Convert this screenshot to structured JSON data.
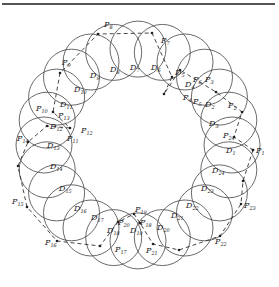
{
  "figure": {
    "type": "ring-of-overlapping-circles",
    "circle_count": 24,
    "ring_center": [
      138,
      145
    ],
    "ring_radius": 94,
    "circle_radius": 28,
    "stroke_color": "#444444",
    "path_color": "#333333"
  },
  "disks": [
    {
      "name": "D",
      "sub": "1",
      "x": 226,
      "y": 153
    },
    {
      "name": "D",
      "sub": "2",
      "x": 205,
      "y": 107
    },
    {
      "name": "D",
      "sub": "3",
      "x": 209,
      "y": 126
    },
    {
      "name": "D",
      "sub": "4",
      "x": 185,
      "y": 87
    },
    {
      "name": "D",
      "sub": "5",
      "x": 175,
      "y": 75
    },
    {
      "name": "D",
      "sub": "6",
      "x": 151,
      "y": 70
    },
    {
      "name": "D",
      "sub": "7",
      "x": 130,
      "y": 70
    },
    {
      "name": "D",
      "sub": "8",
      "x": 110,
      "y": 72
    },
    {
      "name": "D",
      "sub": "9",
      "x": 90,
      "y": 78
    },
    {
      "name": "D",
      "sub": "10",
      "x": 74,
      "y": 92
    },
    {
      "name": "D",
      "sub": "11",
      "x": 60,
      "y": 107
    },
    {
      "name": "D",
      "sub": "12",
      "x": 50,
      "y": 129
    },
    {
      "name": "D",
      "sub": "13",
      "x": 47,
      "y": 148
    },
    {
      "name": "D",
      "sub": "14",
      "x": 50,
      "y": 169
    },
    {
      "name": "D",
      "sub": "15",
      "x": 59,
      "y": 191
    },
    {
      "name": "D",
      "sub": "16",
      "x": 74,
      "y": 211
    },
    {
      "name": "D",
      "sub": "17",
      "x": 91,
      "y": 220
    },
    {
      "name": "D",
      "sub": "18",
      "x": 107,
      "y": 233
    },
    {
      "name": "D",
      "sub": "19",
      "x": 130,
      "y": 233
    },
    {
      "name": "D",
      "sub": "20",
      "x": 157,
      "y": 230
    },
    {
      "name": "D",
      "sub": "21",
      "x": 171,
      "y": 218
    },
    {
      "name": "D",
      "sub": "22",
      "x": 186,
      "y": 208
    },
    {
      "name": "D",
      "sub": "23",
      "x": 201,
      "y": 191
    },
    {
      "name": "D",
      "sub": "24",
      "x": 212,
      "y": 173
    }
  ],
  "points": [
    {
      "name": "P",
      "sub": "1",
      "x": 256,
      "y": 153
    },
    {
      "name": "P",
      "sub": "2",
      "x": 228,
      "y": 108
    },
    {
      "name": "P",
      "sub": "3",
      "x": 205,
      "y": 82
    },
    {
      "name": "P",
      "sub": "4",
      "x": 183,
      "y": 100
    },
    {
      "name": "P",
      "sub": "5",
      "x": 193,
      "y": 104
    },
    {
      "name": "P",
      "sub": "6",
      "x": 193,
      "y": 82
    },
    {
      "name": "P",
      "sub": "7",
      "x": 161,
      "y": 43
    },
    {
      "name": "P",
      "sub": "8",
      "x": 104,
      "y": 27
    },
    {
      "name": "P",
      "sub": "9",
      "x": 62,
      "y": 65
    },
    {
      "name": "P",
      "sub": "10",
      "x": 36,
      "y": 111
    },
    {
      "name": "P",
      "sub": "11",
      "x": 67,
      "y": 141
    },
    {
      "name": "P",
      "sub": "12",
      "x": 81,
      "y": 133
    },
    {
      "name": "P",
      "sub": "13",
      "x": 58,
      "y": 118
    },
    {
      "name": "P",
      "sub": "14",
      "x": 17,
      "y": 141
    },
    {
      "name": "P",
      "sub": "15",
      "x": 12,
      "y": 204
    },
    {
      "name": "P",
      "sub": "16",
      "x": 45,
      "y": 245
    },
    {
      "name": "P",
      "sub": "17",
      "x": 115,
      "y": 252
    },
    {
      "name": "P",
      "sub": "18",
      "x": 140,
      "y": 225
    },
    {
      "name": "P",
      "sub": "19",
      "x": 135,
      "y": 212
    },
    {
      "name": "P",
      "sub": "20",
      "x": 118,
      "y": 225
    },
    {
      "name": "P",
      "sub": "21",
      "x": 146,
      "y": 253
    },
    {
      "name": "P",
      "sub": "22",
      "x": 215,
      "y": 244
    },
    {
      "name": "P",
      "sub": "23",
      "x": 244,
      "y": 208
    },
    {
      "name": "P",
      "sub": "24",
      "x": 223,
      "y": 138
    }
  ],
  "path_nodes": [
    [
      253,
      150
    ],
    [
      243,
      181
    ],
    [
      241,
      204
    ],
    [
      220,
      236
    ],
    [
      179,
      250
    ],
    [
      153,
      244
    ],
    [
      140,
      223
    ],
    [
      134,
      214
    ],
    [
      118,
      222
    ],
    [
      100,
      246
    ],
    [
      57,
      241
    ],
    [
      27,
      207
    ],
    [
      18,
      166
    ],
    [
      28,
      142
    ],
    [
      47,
      126
    ],
    [
      70,
      128
    ],
    [
      53,
      112
    ],
    [
      60,
      73
    ],
    [
      98,
      34
    ],
    [
      152,
      33
    ],
    [
      172,
      77
    ],
    [
      164,
      94
    ],
    [
      180,
      70
    ],
    [
      216,
      92
    ],
    [
      242,
      112
    ],
    [
      234,
      137
    ],
    [
      253,
      150
    ]
  ]
}
